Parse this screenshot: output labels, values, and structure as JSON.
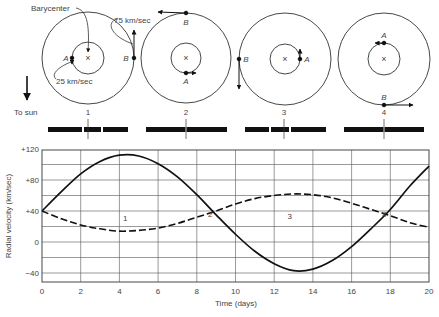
{
  "figure": {
    "orbit_panels": [
      {
        "id": "1",
        "label": "1",
        "star_a": "A",
        "star_b": "B",
        "a_position": "left",
        "b_position": "right",
        "a_motion": "down",
        "b_motion": "up"
      },
      {
        "id": "2",
        "label": "2",
        "star_a": "A",
        "star_b": "B",
        "a_position": "bottom",
        "b_position": "top",
        "a_motion": "right",
        "b_motion": "left"
      },
      {
        "id": "3",
        "label": "3",
        "star_a": "A",
        "star_b": "B",
        "a_position": "right",
        "b_position": "left",
        "a_motion": "up",
        "b_motion": "down"
      },
      {
        "id": "4",
        "label": "4",
        "star_a": "A",
        "star_b": "B",
        "a_position": "top",
        "b_position": "bottom",
        "a_motion": "left",
        "b_motion": "right"
      }
    ],
    "annotations": {
      "barycenter": "Barycenter",
      "speed_b": "75 km/sec",
      "speed_a": "25 km/sec",
      "to_sun": "To sun",
      "center_marker": "×"
    },
    "spectra": [
      {
        "label": "1",
        "lines": "split-3"
      },
      {
        "label": "2",
        "lines": "merged"
      },
      {
        "label": "3",
        "lines": "split-3"
      },
      {
        "label": "4",
        "lines": "merged"
      }
    ]
  },
  "chart_data": {
    "type": "line",
    "title": "",
    "xlabel": "Time (days)",
    "ylabel": "Radial velocity  (km/sec)",
    "xlim": [
      0,
      20
    ],
    "ylim": [
      -52,
      120
    ],
    "grid": true,
    "x_ticks": [
      "0",
      "2",
      "4",
      "6",
      "8",
      "10",
      "12",
      "14",
      "16",
      "18",
      "20"
    ],
    "y_ticks": [
      "+120",
      "+80",
      "+40",
      "0",
      "−40"
    ],
    "x": [
      0,
      1,
      2,
      3,
      4,
      5,
      6,
      7,
      8,
      9,
      10,
      11,
      12,
      13,
      14,
      15,
      16,
      17,
      18,
      19,
      20
    ],
    "series": [
      {
        "name": "Star B (solid)",
        "style": "solid",
        "values": [
          40,
          65,
          88,
          104,
          112,
          111,
          101,
          84,
          61,
          35,
          10,
          -12,
          -28,
          -37,
          -35,
          -24,
          -6,
          17,
          42,
          72,
          98
        ]
      },
      {
        "name": "Star A (dashed)",
        "style": "dashed",
        "values": [
          40,
          30,
          22,
          17,
          14,
          15,
          18,
          24,
          32,
          40,
          49,
          56,
          60,
          62,
          61,
          57,
          50,
          42,
          34,
          25,
          19
        ]
      }
    ],
    "point_labels": [
      {
        "text": "1",
        "x": 4.3,
        "y": 27
      },
      {
        "text": "2",
        "x": 8.7,
        "y": 32
      },
      {
        "text": "3",
        "x": 12.8,
        "y": 30
      },
      {
        "text": "4",
        "x": 17.7,
        "y": 32
      }
    ]
  }
}
